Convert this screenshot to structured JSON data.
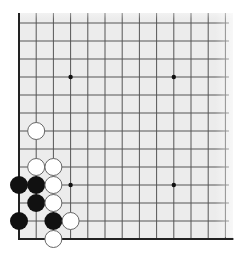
{
  "board": {
    "type": "go-board-corner-fragment",
    "visible_corner": "bottom-left",
    "columns": 13,
    "rows": 13,
    "origin_x": 19,
    "origin_y": 23,
    "col_pitch": 17.2,
    "row_pitch": 18,
    "board_bg": "#ececec",
    "line_color": "#555555",
    "edge_color": "#222222",
    "hoshi_color": "#111111",
    "fade_top": true,
    "fade_right": true,
    "extent": {
      "left": 19,
      "top": 13,
      "right": 233,
      "bottom": 239
    }
  },
  "hoshi": [
    {
      "col": 3,
      "row": 3
    },
    {
      "col": 9,
      "row": 3
    },
    {
      "col": 3,
      "row": 9
    },
    {
      "col": 9,
      "row": 9
    }
  ],
  "stones": [
    {
      "color": "white",
      "col": 1,
      "row": 6
    },
    {
      "color": "white",
      "col": 1,
      "row": 8
    },
    {
      "color": "white",
      "col": 2,
      "row": 8
    },
    {
      "color": "black",
      "col": 0,
      "row": 9
    },
    {
      "color": "black",
      "col": 1,
      "row": 9
    },
    {
      "color": "white",
      "col": 2,
      "row": 9
    },
    {
      "color": "black",
      "col": 1,
      "row": 10
    },
    {
      "color": "white",
      "col": 2,
      "row": 10
    },
    {
      "color": "black",
      "col": 0,
      "row": 11
    },
    {
      "color": "black",
      "col": 2,
      "row": 11
    },
    {
      "color": "white",
      "col": 3,
      "row": 11
    },
    {
      "color": "white",
      "col": 2,
      "row": 12
    }
  ],
  "stone_style": {
    "radius": 9,
    "black_fill": "#111111",
    "white_fill": "#ffffff",
    "white_stroke": "#666666"
  }
}
